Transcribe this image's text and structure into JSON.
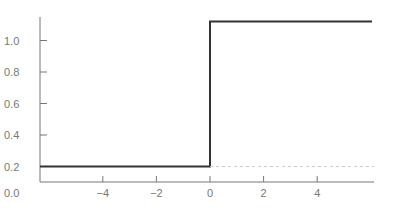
{
  "chart_data": {
    "type": "line",
    "title": "",
    "xlabel": "",
    "ylabel": "",
    "x_ticks": [
      "-4",
      "-2",
      "0",
      "2",
      "4"
    ],
    "y_ticks": [
      "0.0",
      "0.2",
      "0.4",
      "0.6",
      "0.8",
      "1.0"
    ],
    "xlim": [
      -6,
      6
    ],
    "ylim": [
      0.0,
      1.1
    ],
    "grid": false,
    "series": [
      {
        "name": "step",
        "style": "solid",
        "color": "#333333",
        "x": [
          -6,
          0,
          0,
          6
        ],
        "y": [
          0.2,
          0.2,
          1.12,
          1.12
        ]
      },
      {
        "name": "baseline",
        "style": "dashed",
        "color": "#cccccc",
        "x": [
          0,
          6
        ],
        "y": [
          0.2,
          0.2
        ]
      }
    ]
  }
}
